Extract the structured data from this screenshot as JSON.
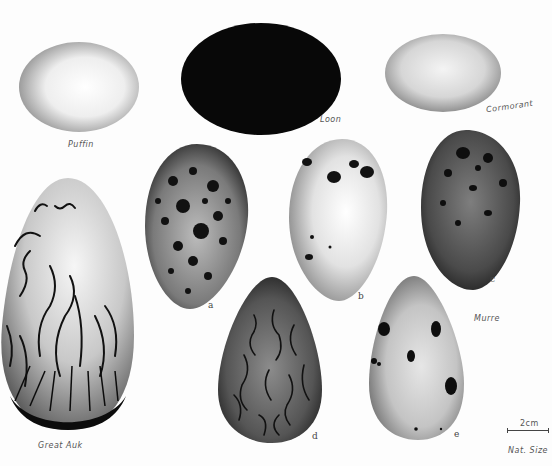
{
  "plate": {
    "title": "Seabird eggs plate (pencil illustration)",
    "labels": {
      "puffin": "Puffin",
      "loon": "Loon",
      "cormorant": "Cormorant",
      "murre": "Murre",
      "great_auk": "Great Auk",
      "letter_a": "a",
      "letter_b": "b",
      "letter_c": "c",
      "letter_d": "d",
      "letter_e": "e",
      "scale_text": "2cm",
      "scale_note": "Nat. Size"
    },
    "eggs": [
      {
        "id": "puffin",
        "shape": "oval",
        "tone": "light"
      },
      {
        "id": "loon",
        "shape": "oval",
        "tone": "black"
      },
      {
        "id": "cormorant",
        "shape": "oval",
        "tone": "light-grey"
      },
      {
        "id": "murre-a",
        "shape": "pyriform",
        "tone": "dark-speckled"
      },
      {
        "id": "murre-b",
        "shape": "pyriform",
        "tone": "pale-blotched"
      },
      {
        "id": "murre-c",
        "shape": "pyriform",
        "tone": "dark-blotched"
      },
      {
        "id": "murre-d",
        "shape": "pyriform",
        "tone": "dark-scrawled"
      },
      {
        "id": "murre-e",
        "shape": "pyriform",
        "tone": "pale-blotched"
      },
      {
        "id": "great-auk",
        "shape": "large-ovate",
        "tone": "pale-scrawled"
      }
    ]
  }
}
